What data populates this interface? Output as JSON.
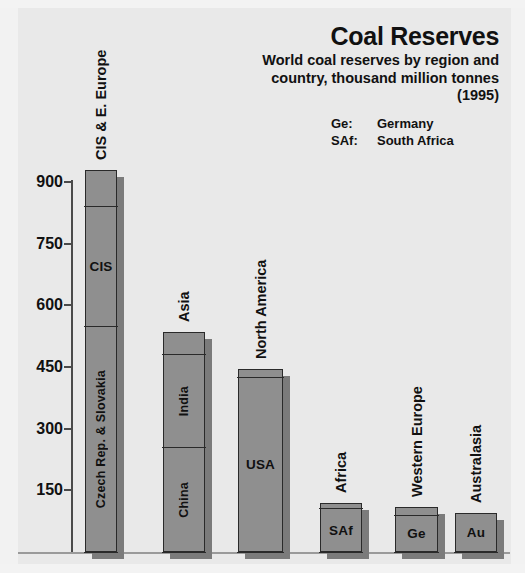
{
  "header": {
    "title": "Coal Reserves",
    "subtitle": "World coal reserves by region and country, thousand million tonnes (1995)",
    "legend": [
      {
        "abbr": "Ge:",
        "name": "Germany"
      },
      {
        "abbr": "SAf:",
        "name": "South Africa"
      }
    ]
  },
  "chart_data": {
    "type": "bar",
    "title": "Coal Reserves",
    "subtitle": "World coal reserves by region and country, thousand million tonnes (1995)",
    "xlabel": "",
    "ylabel": "",
    "ylim": [
      0,
      960
    ],
    "yticks": [
      150,
      300,
      450,
      600,
      750,
      900
    ],
    "grid": false,
    "legend_position": "none",
    "stacked": true,
    "units": "thousand million tonnes",
    "year": 1995,
    "categories": [
      "CIS & E. Europe",
      "Asia",
      "North America",
      "Africa",
      "Western Europe",
      "Australasia"
    ],
    "values": [
      930,
      535,
      445,
      120,
      110,
      95
    ],
    "bars": [
      {
        "label": "CIS & E. Europe",
        "total": 930,
        "segments": [
          {
            "label": "Czech Rep. & Slovakia",
            "from": 0,
            "to": 550,
            "value": 550
          },
          {
            "label": "CIS",
            "from": 550,
            "to": 840,
            "value": 290
          },
          {
            "label": "",
            "from": 840,
            "to": 930,
            "value": 90
          }
        ]
      },
      {
        "label": "Asia",
        "total": 535,
        "segments": [
          {
            "label": "China",
            "from": 0,
            "to": 255,
            "value": 255
          },
          {
            "label": "India",
            "from": 255,
            "to": 480,
            "value": 225
          },
          {
            "label": "",
            "from": 480,
            "to": 535,
            "value": 55
          }
        ]
      },
      {
        "label": "North America",
        "total": 445,
        "segments": [
          {
            "label": "USA",
            "from": 0,
            "to": 425,
            "value": 425
          },
          {
            "label": "",
            "from": 425,
            "to": 445,
            "value": 20
          }
        ]
      },
      {
        "label": "Africa",
        "total": 120,
        "segments": [
          {
            "label": "SAf",
            "from": 0,
            "to": 105,
            "value": 105
          },
          {
            "label": "",
            "from": 105,
            "to": 120,
            "value": 15
          }
        ]
      },
      {
        "label": "Western Europe",
        "total": 110,
        "segments": [
          {
            "label": "Ge",
            "from": 0,
            "to": 90,
            "value": 90
          },
          {
            "label": "",
            "from": 90,
            "to": 110,
            "value": 20
          }
        ]
      },
      {
        "label": "Australasia",
        "total": 95,
        "segments": [
          {
            "label": "Au",
            "from": 0,
            "to": 95,
            "value": 95
          }
        ]
      }
    ],
    "colors": {
      "background": "#e9e9e9",
      "bar_fill": "#8f8f8f",
      "bar_outline": "#2a2a2a",
      "bar_shadow": "#7b7b7b",
      "text": "#111111",
      "axis": "#4a4a4a"
    }
  }
}
